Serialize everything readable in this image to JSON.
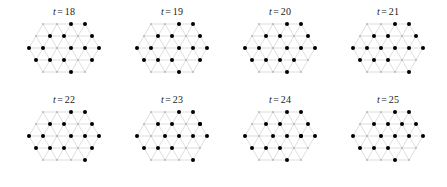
{
  "figure": {
    "type": "small-multiples-lattice-snapshots",
    "rows": 2,
    "columns": 4,
    "background_color": "#ffffff",
    "lattice_line_color": "#c8c8c8",
    "lattice_node_color": "#b4b4b4",
    "particle_color": "#000000",
    "label_color": "#1a1a1a"
  },
  "lattice": {
    "type": "triangular",
    "spacing_x": 14,
    "spacing_y": 12,
    "rows": 5,
    "row_counts": [
      4,
      5,
      6,
      5,
      4
    ],
    "row_offsets": [
      21,
      14,
      7,
      14,
      21
    ],
    "origin_x": 10,
    "origin_y": 6,
    "node_radius": 0.9,
    "particle_radius": 2.0
  },
  "panels": [
    {
      "id": "panel-t18",
      "label_t": "t",
      "label_eq": "=",
      "label_value": "18",
      "particle_count": 16,
      "particles": [
        [
          1,
          1
        ],
        [
          2,
          1
        ],
        [
          4,
          1
        ],
        [
          5,
          1
        ],
        [
          0,
          2
        ],
        [
          1,
          2
        ],
        [
          3,
          2
        ],
        [
          4,
          2
        ],
        [
          5,
          2
        ],
        [
          0,
          3
        ],
        [
          1,
          3
        ],
        [
          2,
          3
        ],
        [
          3,
          0
        ],
        [
          2,
          0
        ],
        [
          2,
          4
        ],
        [
          4,
          3
        ]
      ]
    },
    {
      "id": "panel-t19",
      "label_t": "t",
      "label_eq": "=",
      "label_value": "19",
      "particle_count": 16,
      "particles": [
        [
          1,
          1
        ],
        [
          2,
          1
        ],
        [
          4,
          1
        ],
        [
          5,
          1
        ],
        [
          0,
          2
        ],
        [
          1,
          2
        ],
        [
          3,
          2
        ],
        [
          4,
          2
        ],
        [
          5,
          2
        ],
        [
          0,
          3
        ],
        [
          1,
          3
        ],
        [
          2,
          3
        ],
        [
          2,
          0
        ],
        [
          3,
          0
        ],
        [
          2,
          4
        ],
        [
          4,
          3
        ]
      ]
    },
    {
      "id": "panel-t20",
      "label_t": "t",
      "label_eq": "=",
      "label_value": "20",
      "particle_count": 16,
      "particles": [
        [
          1,
          1
        ],
        [
          2,
          1
        ],
        [
          4,
          1
        ],
        [
          5,
          1
        ],
        [
          0,
          2
        ],
        [
          1,
          2
        ],
        [
          3,
          2
        ],
        [
          4,
          2
        ],
        [
          5,
          2
        ],
        [
          0,
          3
        ],
        [
          1,
          3
        ],
        [
          2,
          3
        ],
        [
          2,
          0
        ],
        [
          3,
          0
        ],
        [
          3,
          3
        ],
        [
          2,
          4
        ]
      ]
    },
    {
      "id": "panel-t21",
      "label_t": "t",
      "label_eq": "=",
      "label_value": "21",
      "particle_count": 16,
      "particles": [
        [
          1,
          1
        ],
        [
          2,
          1
        ],
        [
          4,
          1
        ],
        [
          5,
          1
        ],
        [
          0,
          2
        ],
        [
          1,
          2
        ],
        [
          3,
          2
        ],
        [
          4,
          2
        ],
        [
          5,
          2
        ],
        [
          0,
          3
        ],
        [
          1,
          3
        ],
        [
          2,
          3
        ],
        [
          2,
          0
        ],
        [
          3,
          0
        ],
        [
          3,
          4
        ],
        [
          2,
          2
        ]
      ]
    },
    {
      "id": "panel-t22",
      "label_t": "t",
      "label_eq": "=",
      "label_value": "22",
      "particle_count": 16,
      "particles": [
        [
          1,
          1
        ],
        [
          2,
          1
        ],
        [
          4,
          1
        ],
        [
          5,
          1
        ],
        [
          0,
          2
        ],
        [
          1,
          2
        ],
        [
          3,
          2
        ],
        [
          4,
          2
        ],
        [
          5,
          2
        ],
        [
          0,
          3
        ],
        [
          1,
          3
        ],
        [
          2,
          3
        ],
        [
          2,
          0
        ],
        [
          3,
          0
        ],
        [
          3,
          4
        ],
        [
          4,
          3
        ]
      ]
    },
    {
      "id": "panel-t23",
      "label_t": "t",
      "label_eq": "=",
      "label_value": "23",
      "particle_count": 16,
      "particles": [
        [
          1,
          1
        ],
        [
          2,
          1
        ],
        [
          4,
          1
        ],
        [
          5,
          1
        ],
        [
          0,
          2
        ],
        [
          2,
          2
        ],
        [
          3,
          2
        ],
        [
          4,
          2
        ],
        [
          5,
          2
        ],
        [
          0,
          3
        ],
        [
          1,
          3
        ],
        [
          2,
          3
        ],
        [
          2,
          0
        ],
        [
          3,
          0
        ],
        [
          3,
          4
        ],
        [
          4,
          1
        ]
      ]
    },
    {
      "id": "panel-t24",
      "label_t": "t",
      "label_eq": "=",
      "label_value": "24",
      "particle_count": 16,
      "particles": [
        [
          1,
          1
        ],
        [
          2,
          1
        ],
        [
          4,
          1
        ],
        [
          5,
          1
        ],
        [
          0,
          2
        ],
        [
          2,
          2
        ],
        [
          3,
          2
        ],
        [
          4,
          2
        ],
        [
          5,
          2
        ],
        [
          0,
          3
        ],
        [
          1,
          3
        ],
        [
          2,
          3
        ],
        [
          2,
          0
        ],
        [
          3,
          0
        ],
        [
          2,
          4
        ],
        [
          4,
          2
        ]
      ]
    },
    {
      "id": "panel-t25",
      "label_t": "t",
      "label_eq": "=",
      "label_value": "25",
      "particle_count": 16,
      "particles": [
        [
          1,
          1
        ],
        [
          2,
          1
        ],
        [
          4,
          1
        ],
        [
          5,
          1
        ],
        [
          0,
          2
        ],
        [
          2,
          2
        ],
        [
          3,
          2
        ],
        [
          4,
          2
        ],
        [
          5,
          2
        ],
        [
          0,
          3
        ],
        [
          1,
          3
        ],
        [
          2,
          3
        ],
        [
          2,
          0
        ],
        [
          3,
          0
        ],
        [
          2,
          4
        ],
        [
          3,
          1
        ]
      ]
    }
  ]
}
